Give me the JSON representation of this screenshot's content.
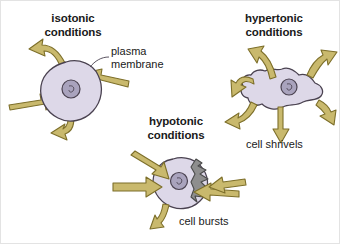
{
  "figure": {
    "background_color": "#ffffff",
    "border_color": "#e3e3e3",
    "cell_fill": "#ddd8e8",
    "cell_stroke": "#4a4250",
    "nucleus_fill": "#a9a3bd",
    "nucleus_stroke": "#4a4250",
    "arrow_fill": "#c9b96d",
    "arrow_stroke": "#7d6f2a",
    "burst_fill": "#8e8e8e",
    "burst_stroke": "#4a4a4a",
    "text_color": "#1a1a1a"
  },
  "panels": {
    "isotonic": {
      "title": "isotonic\nconditions",
      "label_plasma_membrane": "plasma\nmembrane",
      "water_in_arrows": 2,
      "water_out_arrows": 2
    },
    "hypertonic": {
      "title": "hypertonic\nconditions",
      "caption": "cell shrivels",
      "water_in_arrows": 0,
      "water_out_arrows": 6
    },
    "hypotonic": {
      "title": "hypotonic\nconditions",
      "caption": "cell bursts",
      "water_in_arrows": 4,
      "water_out_arrows": 1
    }
  }
}
